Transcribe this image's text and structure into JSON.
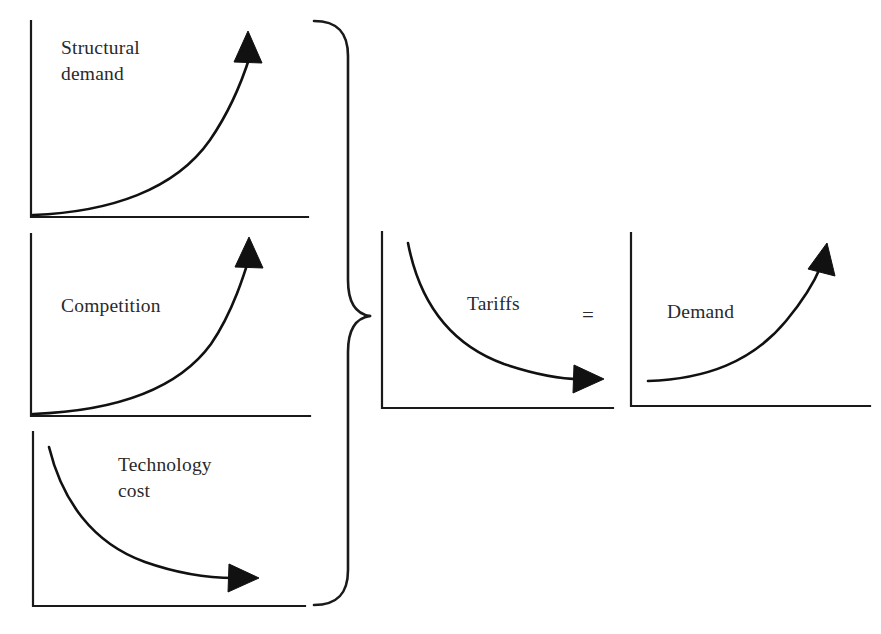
{
  "diagram": {
    "type": "conceptual-curve-diagram",
    "background_color": "#ffffff",
    "ink_color": "#111111",
    "operator": {
      "symbol": "=",
      "name": "equals-operator"
    },
    "grouping": {
      "brace_name": "curly-brace",
      "brace_orientation": "right-pointing",
      "groups_panels": [
        "structural-demand",
        "competition",
        "technology-cost"
      ],
      "points_to_panel": "tariffs"
    },
    "panels": [
      {
        "id": "structural-demand",
        "label": "Structural\ndemand",
        "label_line1": "Structural",
        "label_line2": "demand",
        "trend": "increasing",
        "arrow_direction": "up-right",
        "curve_shape": "exponential-growth",
        "axes": "two-axis-L-frame"
      },
      {
        "id": "competition",
        "label": "Competition",
        "label_line1": "Competition",
        "label_line2": "",
        "trend": "increasing",
        "arrow_direction": "up-right",
        "curve_shape": "exponential-growth",
        "axes": "two-axis-L-frame"
      },
      {
        "id": "technology-cost",
        "label": "Technology\ncost",
        "label_line1": "Technology",
        "label_line2": "cost",
        "trend": "decreasing",
        "arrow_direction": "right",
        "curve_shape": "exponential-decay",
        "axes": "two-axis-L-frame"
      },
      {
        "id": "tariffs",
        "label": "Tariffs",
        "label_line1": "Tariffs",
        "label_line2": "",
        "trend": "decreasing",
        "arrow_direction": "right",
        "curve_shape": "exponential-decay",
        "axes": "two-axis-L-frame"
      },
      {
        "id": "demand",
        "label": "Demand",
        "label_line1": "Demand",
        "label_line2": "",
        "trend": "increasing",
        "arrow_direction": "up-right",
        "curve_shape": "exponential-growth",
        "axes": "two-axis-L-frame"
      }
    ]
  }
}
